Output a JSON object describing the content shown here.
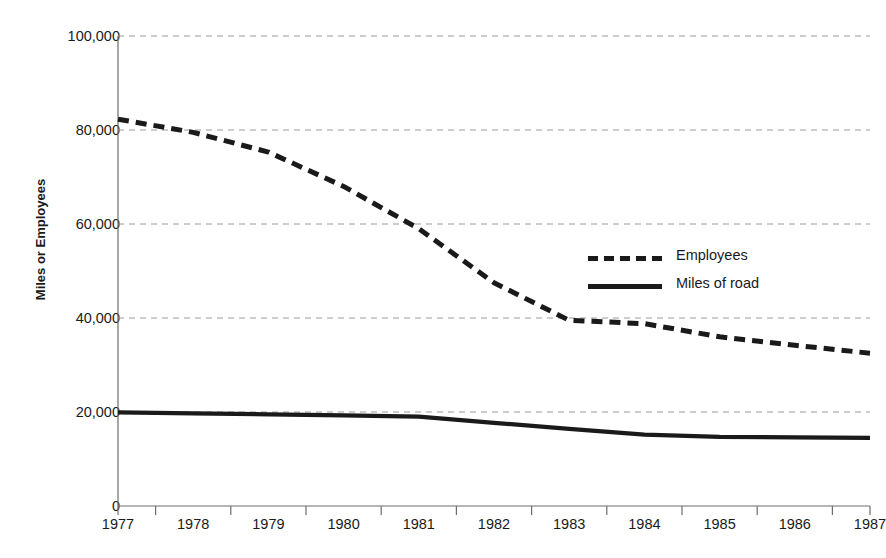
{
  "chart_data": {
    "type": "line",
    "title": "",
    "xlabel": "",
    "ylabel": "Miles or Employees",
    "x": [
      1977,
      1978,
      1979,
      1980,
      1981,
      1982,
      1983,
      1984,
      1985,
      1986,
      1987
    ],
    "categories": [
      "1977",
      "1978",
      "1979",
      "1980",
      "1981",
      "1982",
      "1983",
      "1984",
      "1985",
      "1986",
      "1987"
    ],
    "xlim": [
      1977,
      1987
    ],
    "ylim": [
      0,
      100000
    ],
    "yticks": [
      0,
      20000,
      40000,
      60000,
      80000,
      100000
    ],
    "ytick_labels": [
      "0",
      "20,000",
      "40,000",
      "60,000",
      "80,000",
      "100,000"
    ],
    "grid": "horizontal-dashed",
    "legend_position": "center-right",
    "series": [
      {
        "name": "Employees",
        "style": "dashed",
        "color": "#1a1a1a",
        "values": [
          82300,
          79500,
          75300,
          68000,
          59000,
          47500,
          39500,
          38800,
          36000,
          34200,
          32500
        ]
      },
      {
        "name": "Miles of road",
        "style": "solid",
        "color": "#1a1a1a",
        "values": [
          19900,
          19700,
          19500,
          19300,
          19000,
          17700,
          16400,
          15200,
          14700,
          14600,
          14500
        ]
      }
    ]
  },
  "legend": {
    "items": [
      {
        "label": "Employees",
        "style": "dashed"
      },
      {
        "label": "Miles of road",
        "style": "solid"
      }
    ]
  },
  "plot": {
    "left": 118,
    "right": 870,
    "top": 36,
    "bottom": 506
  }
}
